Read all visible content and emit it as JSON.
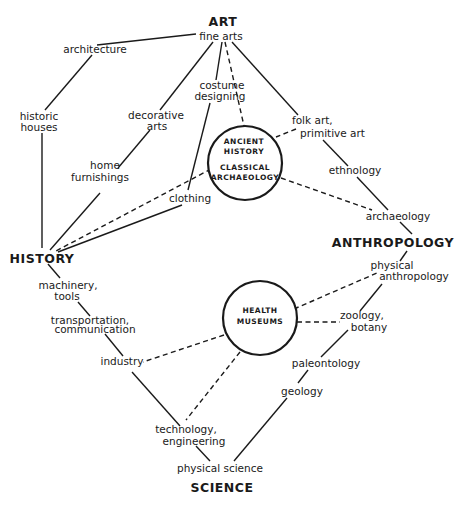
{
  "diagram": {
    "hubs": {
      "art": "ART",
      "history": "HISTORY",
      "anthropology": "ANTHROPOLOGY",
      "science": "SCIENCE"
    },
    "circles": {
      "ancient": {
        "line1": "ANCIENT",
        "line2": "HISTORY",
        "line3": "CLASSICAL",
        "line4": "ARCHAEOLOGY"
      },
      "health": {
        "line1": "HEALTH",
        "line2": "MUSEUMS"
      }
    },
    "nodes": {
      "fine_arts": "fine arts",
      "architecture": "architecture",
      "historic_houses_1": "historic",
      "historic_houses_2": "houses",
      "decorative_arts_1": "decorative",
      "decorative_arts_2": "arts",
      "home_furnishings_1": "home",
      "home_furnishings_2": "furnishings",
      "costume_designing_1": "costume",
      "costume_designing_2": "designing",
      "clothing": "clothing",
      "folk_art_1": "folk art,",
      "folk_art_2": "primitive art",
      "ethnology": "ethnology",
      "archaeology": "archaeology",
      "physical_anthropology_1": "physical",
      "physical_anthropology_2": "anthropology",
      "zoology_botany_1": "zoology,",
      "zoology_botany_2": "botany",
      "paleontology": "paleontology",
      "geology": "geology",
      "machinery_tools_1": "machinery,",
      "machinery_tools_2": "tools",
      "transport_comm_1": "transportation,",
      "transport_comm_2": "communication",
      "industry": "industry",
      "technology_engineering_1": "technology,",
      "technology_engineering_2": "engineering",
      "physical_science": "physical science"
    },
    "edges_solid": [
      [
        "fine arts",
        "architecture"
      ],
      [
        "architecture",
        "historic houses"
      ],
      [
        "historic houses",
        "HISTORY"
      ],
      [
        "fine arts",
        "decorative arts"
      ],
      [
        "decorative arts",
        "home furnishings"
      ],
      [
        "home furnishings",
        "HISTORY"
      ],
      [
        "fine arts",
        "costume designing"
      ],
      [
        "costume designing",
        "clothing"
      ],
      [
        "clothing",
        "HISTORY"
      ],
      [
        "fine arts",
        "folk art, primitive art"
      ],
      [
        "folk art, primitive art",
        "ethnology"
      ],
      [
        "ethnology",
        "archaeology"
      ],
      [
        "archaeology",
        "ANTHROPOLOGY"
      ],
      [
        "ANTHROPOLOGY",
        "physical anthropology"
      ],
      [
        "physical anthropology",
        "zoology, botany"
      ],
      [
        "zoology, botany",
        "paleontology"
      ],
      [
        "paleontology",
        "geology"
      ],
      [
        "geology",
        "physical science"
      ],
      [
        "HISTORY",
        "machinery, tools"
      ],
      [
        "machinery, tools",
        "transportation, communication"
      ],
      [
        "transportation, communication",
        "industry"
      ],
      [
        "industry",
        "technology, engineering"
      ],
      [
        "technology, engineering",
        "physical science"
      ]
    ],
    "edges_dashed": [
      [
        "fine arts",
        "ANCIENT HISTORY / CLASSICAL ARCHAEOLOGY"
      ],
      [
        "folk art, primitive art",
        "ANCIENT HISTORY / CLASSICAL ARCHAEOLOGY"
      ],
      [
        "archaeology",
        "ANCIENT HISTORY / CLASSICAL ARCHAEOLOGY"
      ],
      [
        "HISTORY",
        "ANCIENT HISTORY / CLASSICAL ARCHAEOLOGY"
      ],
      [
        "physical anthropology",
        "HEALTH MUSEUMS"
      ],
      [
        "zoology, botany",
        "HEALTH MUSEUMS"
      ],
      [
        "industry",
        "HEALTH MUSEUMS"
      ],
      [
        "technology, engineering",
        "HEALTH MUSEUMS"
      ]
    ]
  }
}
